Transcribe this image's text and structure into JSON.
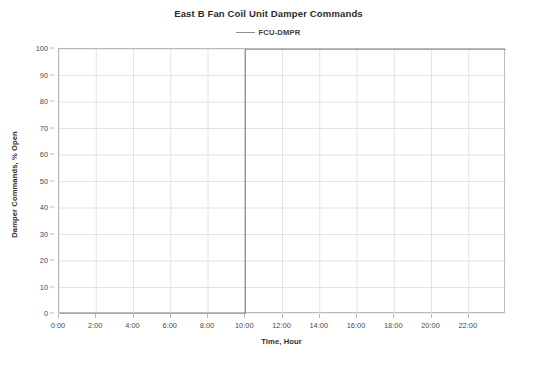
{
  "chart_data": {
    "type": "line",
    "title": "East B Fan Coil Unit Damper Commands",
    "xlabel": "Time, Hour",
    "ylabel": "Damper Commands, % Open",
    "xlim": [
      0,
      24
    ],
    "ylim": [
      0,
      100
    ],
    "grid": true,
    "legend_position": "top-center",
    "x_tick_labels": [
      "0:00",
      "2:00",
      "4:00",
      "6:00",
      "8:00",
      "10:00",
      "12:00",
      "14:00",
      "16:00",
      "18:00",
      "20:00",
      "22:00"
    ],
    "x_tick_values": [
      0,
      2,
      4,
      6,
      8,
      10,
      12,
      14,
      16,
      18,
      20,
      22
    ],
    "y_tick_labels": [
      "0",
      "10",
      "20",
      "30",
      "40",
      "50",
      "60",
      "70",
      "80",
      "90",
      "100"
    ],
    "y_tick_values": [
      0,
      10,
      20,
      30,
      40,
      50,
      60,
      70,
      80,
      90,
      100
    ],
    "series": [
      {
        "name": "FCU-DMPR",
        "color": "#8e8e8e",
        "x": [
          0,
          1,
          2,
          3,
          4,
          5,
          6,
          7,
          8,
          9,
          10,
          10,
          11,
          12,
          13,
          14,
          15,
          16,
          17,
          18,
          19,
          20,
          21,
          22,
          23,
          24
        ],
        "values": [
          0,
          0,
          0,
          0,
          0,
          0,
          0,
          0,
          0,
          0,
          0,
          100,
          100,
          100,
          100,
          100,
          100,
          100,
          100,
          100,
          100,
          100,
          100,
          100,
          100,
          100
        ]
      }
    ]
  },
  "legend": {
    "entries": [
      {
        "label": "FCU-DMPR"
      }
    ]
  }
}
